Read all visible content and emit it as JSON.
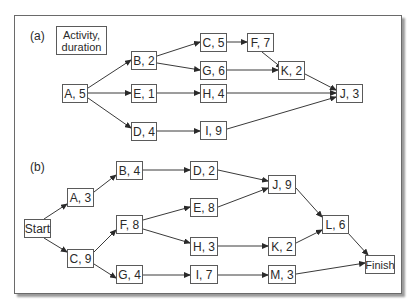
{
  "panel_a": {
    "label": "(a)",
    "legend": {
      "line1": "Activity,",
      "line2": "duration"
    },
    "nodes": {
      "A": "A, 5",
      "B": "B, 2",
      "E": "E, 1",
      "D": "D, 4",
      "C": "C, 5",
      "G": "G, 6",
      "H": "H, 4",
      "I": "I, 9",
      "F": "F, 7",
      "K": "K, 2",
      "J": "J, 3"
    },
    "edges": [
      [
        "A",
        "B"
      ],
      [
        "A",
        "E"
      ],
      [
        "A",
        "D"
      ],
      [
        "B",
        "C"
      ],
      [
        "B",
        "G"
      ],
      [
        "E",
        "H"
      ],
      [
        "D",
        "I"
      ],
      [
        "C",
        "F"
      ],
      [
        "F",
        "K"
      ],
      [
        "G",
        "K"
      ],
      [
        "K",
        "J"
      ],
      [
        "H",
        "J"
      ],
      [
        "I",
        "J"
      ]
    ]
  },
  "panel_b": {
    "label": "(b)",
    "nodes": {
      "Start": "Start",
      "A": "A, 3",
      "C": "C, 9",
      "B": "B, 4",
      "F": "F, 8",
      "G": "G, 4",
      "D": "D, 2",
      "E": "E, 8",
      "H": "H, 3",
      "I": "I, 7",
      "J": "J, 9",
      "K": "K, 2",
      "M": "M, 3",
      "L": "L, 6",
      "Finish": "Finish"
    },
    "edges": [
      [
        "Start",
        "A"
      ],
      [
        "Start",
        "C"
      ],
      [
        "A",
        "B"
      ],
      [
        "C",
        "F"
      ],
      [
        "C",
        "G"
      ],
      [
        "B",
        "D"
      ],
      [
        "F",
        "E"
      ],
      [
        "F",
        "H"
      ],
      [
        "G",
        "I"
      ],
      [
        "D",
        "J"
      ],
      [
        "E",
        "J"
      ],
      [
        "H",
        "K"
      ],
      [
        "I",
        "M"
      ],
      [
        "J",
        "L"
      ],
      [
        "K",
        "L"
      ],
      [
        "L",
        "Finish"
      ],
      [
        "M",
        "Finish"
      ]
    ]
  },
  "colors": {
    "line": "#3a3a3a",
    "border": "#5a5a5a",
    "text": "#2a2a2a"
  }
}
